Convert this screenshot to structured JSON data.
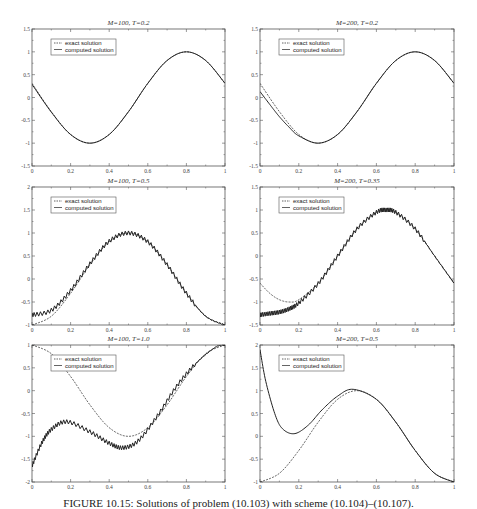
{
  "figure": {
    "caption": "FIGURE 10.15: Solutions of problem (10.103) with scheme (10.104)–(10.107).",
    "colors": {
      "line": "#222222",
      "axis": "#555555",
      "background": "#ffffff"
    }
  },
  "chart_data": [
    {
      "type": "line",
      "title": "M=100, T=0.2",
      "xlabel": "",
      "ylabel": "",
      "xlim": [
        0,
        1
      ],
      "ylim": [
        -1.5,
        1.5
      ],
      "xticks": [
        "0",
        "0.2",
        "0.4",
        "0.6",
        "0.8",
        "1"
      ],
      "yticks": [
        "-1.5",
        "-1",
        "-0.5",
        "0",
        "0.5",
        "1",
        "1.5"
      ],
      "grid": false,
      "legend": {
        "position": "upper-left",
        "entries": [
          "exact solution",
          "computed solution"
        ]
      },
      "series": [
        {
          "name": "exact solution",
          "style": "dashed",
          "x": [
            0,
            0.1,
            0.2,
            0.3,
            0.4,
            0.5,
            0.6,
            0.7,
            0.8,
            0.9,
            1.0
          ],
          "y": [
            0.31,
            -0.31,
            -0.81,
            -1.0,
            -0.81,
            -0.31,
            0.31,
            0.81,
            1.0,
            0.81,
            0.31
          ]
        },
        {
          "name": "computed solution",
          "style": "solid-with-markers",
          "x": [
            0,
            0.1,
            0.2,
            0.3,
            0.4,
            0.5,
            0.6,
            0.7,
            0.8,
            0.9,
            1.0
          ],
          "y": [
            0.29,
            -0.32,
            -0.81,
            -1.0,
            -0.81,
            -0.31,
            0.31,
            0.81,
            1.0,
            0.81,
            0.31
          ]
        }
      ]
    },
    {
      "type": "line",
      "title": "M=200, T=0.2",
      "xlabel": "",
      "ylabel": "",
      "xlim": [
        0,
        1
      ],
      "ylim": [
        -1.5,
        1.5
      ],
      "xticks": [
        "0",
        "0.2",
        "0.4",
        "0.6",
        "0.8",
        "1"
      ],
      "yticks": [
        "-1.5",
        "-1",
        "-0.5",
        "0",
        "0.5",
        "1",
        "1.5"
      ],
      "grid": false,
      "legend": {
        "position": "upper-left",
        "entries": [
          "exact solution",
          "computed solution"
        ]
      },
      "series": [
        {
          "name": "exact solution",
          "style": "dashed",
          "x": [
            0,
            0.1,
            0.2,
            0.3,
            0.4,
            0.5,
            0.6,
            0.7,
            0.8,
            0.9,
            1.0
          ],
          "y": [
            0.31,
            -0.31,
            -0.81,
            -1.0,
            -0.81,
            -0.31,
            0.31,
            0.81,
            1.0,
            0.81,
            0.31
          ]
        },
        {
          "name": "computed solution",
          "style": "solid-with-markers",
          "x": [
            0,
            0.05,
            0.1,
            0.15,
            0.2,
            0.3,
            0.4,
            0.5,
            0.6,
            0.7,
            0.8,
            0.9,
            1.0
          ],
          "y": [
            0.13,
            -0.15,
            -0.42,
            -0.65,
            -0.84,
            -1.0,
            -0.81,
            -0.31,
            0.31,
            0.81,
            1.0,
            0.81,
            0.31
          ]
        }
      ]
    },
    {
      "type": "line",
      "title": "M=100, T=0.5",
      "xlabel": "",
      "ylabel": "",
      "xlim": [
        0,
        1
      ],
      "ylim": [
        -1,
        2
      ],
      "xticks": [
        "0",
        "0.2",
        "0.4",
        "0.6",
        "0.8",
        "1"
      ],
      "yticks": [
        "-1",
        "-0.5",
        "0",
        "0.5",
        "1",
        "1.5",
        "2"
      ],
      "grid": false,
      "legend": {
        "position": "upper-left",
        "entries": [
          "exact solution",
          "computed solution"
        ]
      },
      "series": [
        {
          "name": "exact solution",
          "style": "dashed",
          "x": [
            0,
            0.1,
            0.2,
            0.3,
            0.4,
            0.5,
            0.6,
            0.7,
            0.8,
            0.9,
            1.0
          ],
          "y": [
            -1.0,
            -0.81,
            -0.31,
            0.31,
            0.81,
            1.0,
            0.81,
            0.31,
            -0.31,
            -0.81,
            -1.0
          ]
        },
        {
          "name": "computed solution",
          "style": "solid-oscillating",
          "x": [
            0,
            0.1,
            0.2,
            0.3,
            0.4,
            0.5,
            0.6,
            0.7,
            0.8,
            0.9,
            1.0
          ],
          "y": [
            -0.78,
            -0.68,
            -0.25,
            0.33,
            0.82,
            1.0,
            0.81,
            0.31,
            -0.31,
            -0.81,
            -1.0
          ]
        }
      ]
    },
    {
      "type": "line",
      "title": "M=200, T=0.35",
      "xlabel": "",
      "ylabel": "",
      "xlim": [
        0,
        1
      ],
      "ylim": [
        -1.5,
        1.5
      ],
      "xticks": [
        "0",
        "0.2",
        "0.4",
        "0.6",
        "0.8",
        "1"
      ],
      "yticks": [
        "-1.5",
        "-1",
        "-0.5",
        "0",
        "0.5",
        "1",
        "1.5"
      ],
      "grid": false,
      "legend": {
        "position": "upper-left",
        "entries": [
          "exact solution",
          "computed solution"
        ]
      },
      "series": [
        {
          "name": "exact solution",
          "style": "dashed",
          "x": [
            0,
            0.05,
            0.1,
            0.15,
            0.2,
            0.3,
            0.4,
            0.5,
            0.6,
            0.65,
            0.7,
            0.8,
            0.9,
            1.0
          ],
          "y": [
            -0.59,
            -0.81,
            -0.95,
            -1.0,
            -0.95,
            -0.59,
            0.0,
            0.59,
            0.95,
            1.0,
            0.95,
            0.59,
            0.0,
            -0.59
          ]
        },
        {
          "name": "computed solution",
          "style": "solid-oscillating",
          "x": [
            0,
            0.05,
            0.1,
            0.15,
            0.2,
            0.3,
            0.4,
            0.5,
            0.6,
            0.65,
            0.7,
            0.8,
            0.9,
            1.0
          ],
          "y": [
            -1.28,
            -1.25,
            -1.22,
            -1.15,
            -1.02,
            -0.6,
            0.0,
            0.59,
            0.95,
            1.0,
            0.95,
            0.59,
            0.0,
            -0.59
          ]
        }
      ]
    },
    {
      "type": "line",
      "title": "M=100, T=1.0",
      "xlabel": "",
      "ylabel": "",
      "xlim": [
        0,
        1
      ],
      "ylim": [
        -2,
        1
      ],
      "xticks": [
        "0",
        "0.2",
        "0.4",
        "0.6",
        "0.8",
        "1"
      ],
      "yticks": [
        "-2",
        "-1.5",
        "-1",
        "-0.5",
        "0",
        "0.5",
        "1"
      ],
      "grid": false,
      "legend": {
        "position": "upper-left",
        "entries": [
          "exact solution",
          "computed solution"
        ]
      },
      "series": [
        {
          "name": "exact solution",
          "style": "dashed",
          "x": [
            0,
            0.1,
            0.2,
            0.3,
            0.4,
            0.5,
            0.6,
            0.7,
            0.8,
            0.9,
            1.0
          ],
          "y": [
            1.0,
            0.81,
            0.31,
            -0.31,
            -0.81,
            -1.0,
            -0.81,
            -0.31,
            0.31,
            0.81,
            1.0
          ]
        },
        {
          "name": "computed solution",
          "style": "solid-oscillating",
          "x": [
            0,
            0.05,
            0.1,
            0.18,
            0.3,
            0.4,
            0.47,
            0.55,
            0.65,
            0.75,
            0.85,
            0.95,
            1.0
          ],
          "y": [
            -1.65,
            -1.15,
            -0.85,
            -0.68,
            -0.9,
            -1.15,
            -1.25,
            -1.1,
            -0.55,
            0.1,
            0.6,
            0.95,
            1.0
          ]
        }
      ]
    },
    {
      "type": "line",
      "title": "M=200, T=0.5",
      "xlabel": "",
      "ylabel": "",
      "xlim": [
        0,
        1
      ],
      "ylim": [
        -1,
        2
      ],
      "xticks": [
        "0",
        "0.2",
        "0.4",
        "0.6",
        "0.8",
        "1"
      ],
      "yticks": [
        "-1",
        "-0.5",
        "0",
        "0.5",
        "1",
        "1.5",
        "2"
      ],
      "grid": false,
      "legend": {
        "position": "upper-left",
        "entries": [
          "exact solution",
          "computed solution"
        ]
      },
      "series": [
        {
          "name": "exact solution",
          "style": "dashed",
          "x": [
            0,
            0.1,
            0.2,
            0.3,
            0.4,
            0.5,
            0.6,
            0.7,
            0.8,
            0.9,
            1.0
          ],
          "y": [
            -1.0,
            -0.81,
            -0.31,
            0.31,
            0.81,
            1.0,
            0.81,
            0.31,
            -0.31,
            -0.81,
            -1.0
          ]
        },
        {
          "name": "computed solution",
          "style": "solid-with-markers",
          "x": [
            0,
            0.03,
            0.08,
            0.12,
            0.18,
            0.25,
            0.32,
            0.4,
            0.48,
            0.6,
            0.7,
            0.8,
            0.9,
            1.0
          ],
          "y": [
            1.9,
            1.2,
            0.45,
            0.15,
            0.06,
            0.25,
            0.58,
            0.88,
            1.03,
            0.81,
            0.31,
            -0.31,
            -0.81,
            -1.0
          ]
        }
      ]
    }
  ]
}
